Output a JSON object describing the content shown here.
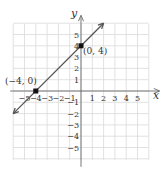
{
  "chart_data": {
    "type": "line",
    "title": "",
    "xlabel": "x",
    "ylabel": "y",
    "xlim": [
      -6,
      6
    ],
    "ylim": [
      -6,
      6
    ],
    "grid": true,
    "x_ticks": [
      -5,
      -4,
      -3,
      -2,
      -1,
      1,
      2,
      3,
      4,
      5
    ],
    "y_ticks": [
      -5,
      -4,
      -3,
      -2,
      -1,
      1,
      2,
      3,
      4,
      5
    ],
    "x_tick_labels": [
      "−5",
      "−4",
      "−3",
      "−2",
      "−1",
      "1",
      "2",
      "3",
      "4",
      "5"
    ],
    "y_tick_labels": [
      "−5",
      "−4",
      "−3",
      "−2",
      "−1",
      "1",
      "2",
      "3",
      "4",
      "5"
    ],
    "series": [
      {
        "name": "y = x + 4",
        "x": [
          -6,
          2
        ],
        "y": [
          -2,
          6
        ],
        "arrows_both_ends": true
      }
    ],
    "points": [
      {
        "x": -4,
        "y": 0,
        "label": "(−4, 0)"
      },
      {
        "x": 0,
        "y": 4,
        "label": "(0, 4)"
      }
    ],
    "colors": {
      "line": "#555555",
      "grid": "#d9d9d9",
      "axis": "#666666",
      "point": "#111111"
    }
  }
}
